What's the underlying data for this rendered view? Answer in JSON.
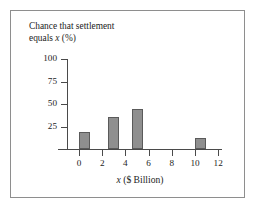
{
  "chart_data": {
    "type": "bar",
    "title": "Chance that settlement equals x (%)",
    "title_lines": [
      "Chance that settlement",
      "equals x (%)"
    ],
    "xlabel": "x ($ Billion)",
    "ylabel": "Chance that settlement equals x (%)",
    "xlim": [
      -1,
      13
    ],
    "ylim": [
      0,
      100
    ],
    "grid": false,
    "legend": null,
    "x_ticks": [
      {
        "value": 0,
        "label": "0"
      },
      {
        "value": 2,
        "label": "2"
      },
      {
        "value": 4,
        "label": "4"
      },
      {
        "value": 6,
        "label": "6"
      },
      {
        "value": 8,
        "label": "8"
      },
      {
        "value": 10,
        "label": "10"
      },
      {
        "value": 12,
        "label": "12"
      }
    ],
    "y_ticks": [
      {
        "value": 25,
        "label": "25"
      },
      {
        "value": 50,
        "label": "50"
      },
      {
        "value": 75,
        "label": "75"
      },
      {
        "value": 100,
        "label": "100"
      }
    ],
    "x": [
      0.5,
      3,
      5,
      10.5
    ],
    "values": [
      19,
      36,
      44,
      12
    ],
    "bars": [
      {
        "x": 0.5,
        "value": 19
      },
      {
        "x": 3,
        "value": 36
      },
      {
        "x": 5,
        "value": 44
      },
      {
        "x": 10.5,
        "value": 12
      }
    ],
    "bar_color": "#8f8f8f",
    "bar_edge_color": "#5a5a5a",
    "axis_color": "#4a4a4a",
    "frame_color": "#8e8e8e",
    "background_color": "#ffffff"
  }
}
